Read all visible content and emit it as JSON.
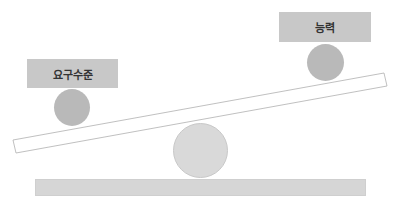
{
  "diagram": {
    "type": "seesaw",
    "left_label": "요구수준",
    "right_label": "능력",
    "colors": {
      "label_fill": "#c8c8c8",
      "weight_circle": "#b9b9b9",
      "fulcrum_circle": "#d9d9d9",
      "base_bar": "#d6d6d6",
      "plank_stroke": "#b0b0b0"
    }
  }
}
